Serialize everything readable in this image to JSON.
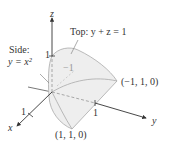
{
  "diagram": {
    "axes": {
      "x_label": "x",
      "y_label": "y",
      "z_label": "z",
      "x_tick": "1",
      "y_tick": "1",
      "z_tick": "1",
      "neg_tick": "−1"
    },
    "labels": {
      "top": "Top:  y + z = 1",
      "side_line1": "Side:",
      "side_line2": "y = x²",
      "point_a": "(−1, 1, 0)",
      "point_b": "(1, 1, 0)"
    },
    "colors": {
      "surface_fill": "#eeeeee",
      "surface_stroke": "#aaaaaa",
      "axis": "#333333"
    }
  }
}
